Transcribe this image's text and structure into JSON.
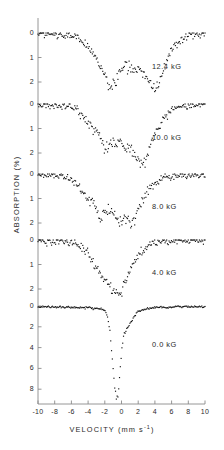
{
  "figure": {
    "xlabel_text": "VELOCITY (mm s",
    "xlabel_sup": "-1",
    "xlabel_tail": ")",
    "ylabel": "ABSORPTION (%)"
  },
  "axis": {
    "x_ticks": [
      -10,
      -8,
      -6,
      -4,
      -2,
      0,
      2,
      4,
      6,
      8,
      10
    ],
    "x_tick_labels": [
      "-10",
      "-8",
      "-6",
      "-4",
      "-2",
      "0",
      "2",
      "4",
      "6",
      "8",
      "10"
    ]
  },
  "panels": [
    {
      "label": "12.4 kG",
      "y_ticks": [
        0,
        1,
        2
      ],
      "y_tick_labels": [
        "0",
        "1",
        "2"
      ]
    },
    {
      "label": "10.0 kG",
      "y_ticks": [
        0,
        1,
        2
      ],
      "y_tick_labels": [
        "0",
        "1",
        "2"
      ]
    },
    {
      "label": "8.0 kG",
      "y_ticks": [
        0,
        1,
        2
      ],
      "y_tick_labels": [
        "0",
        "1",
        "2"
      ]
    },
    {
      "label": "4.0 kG",
      "y_ticks": [
        0,
        1,
        2
      ],
      "y_tick_labels": [
        "0",
        "1",
        "2"
      ]
    },
    {
      "label": "0.0 kG",
      "y_ticks": [
        0,
        2,
        4,
        6,
        8
      ],
      "y_tick_labels": [
        "0",
        "2",
        "4",
        "6",
        "8"
      ]
    }
  ],
  "chart_data": {
    "type": "scatter",
    "title": "",
    "xlabel": "VELOCITY (mm s^-1)",
    "ylabel": "ABSORPTION (%)",
    "xlim": [
      -10,
      10
    ],
    "grid": false,
    "legend": "none",
    "marker_color": "#111111",
    "note": "Mossbauer absorption spectra at five applied magnetic fields; absorption axis increases downward.",
    "panels": [
      {
        "name": "12.4 kG",
        "ylim": [
          0,
          2.6
        ],
        "y_ticks": [
          0,
          1,
          2
        ],
        "x": [
          -10.0,
          -9.6,
          -9.2,
          -8.8,
          -8.4,
          -8.0,
          -7.6,
          -7.2,
          -6.8,
          -6.4,
          -6.0,
          -5.6,
          -5.2,
          -4.8,
          -4.4,
          -4.0,
          -3.6,
          -3.2,
          -2.8,
          -2.4,
          -2.0,
          -1.6,
          -1.2,
          -0.8,
          -0.4,
          0.0,
          0.4,
          0.8,
          1.2,
          1.6,
          2.0,
          2.4,
          2.8,
          3.2,
          3.6,
          4.0,
          4.4,
          4.8,
          5.2,
          5.6,
          6.0,
          6.4,
          6.8,
          7.2,
          7.6,
          8.0,
          8.4,
          8.8,
          9.2,
          9.6,
          10.0
        ],
        "y": [
          0.02,
          0.0,
          0.05,
          0.03,
          0.08,
          0.04,
          0.1,
          0.06,
          0.12,
          0.09,
          0.15,
          0.12,
          0.2,
          0.28,
          0.4,
          0.55,
          0.75,
          0.95,
          1.15,
          1.45,
          1.8,
          2.1,
          2.3,
          2.05,
          1.7,
          1.45,
          1.35,
          1.4,
          1.38,
          1.45,
          1.42,
          1.55,
          1.7,
          1.95,
          2.2,
          2.35,
          2.1,
          1.7,
          1.3,
          1.0,
          0.75,
          0.55,
          0.38,
          0.25,
          0.18,
          0.12,
          0.08,
          0.1,
          0.05,
          0.08,
          0.04
        ]
      },
      {
        "name": "10.0 kG",
        "ylim": [
          0,
          2.6
        ],
        "y_ticks": [
          0,
          1,
          2
        ],
        "x": [
          -10.0,
          -9.6,
          -9.2,
          -8.8,
          -8.4,
          -8.0,
          -7.6,
          -7.2,
          -6.8,
          -6.4,
          -6.0,
          -5.6,
          -5.2,
          -4.8,
          -4.4,
          -4.0,
          -3.6,
          -3.2,
          -2.8,
          -2.4,
          -2.0,
          -1.6,
          -1.2,
          -0.8,
          -0.4,
          0.0,
          0.4,
          0.8,
          1.2,
          1.6,
          2.0,
          2.4,
          2.8,
          3.2,
          3.6,
          4.0,
          4.4,
          4.8,
          5.2,
          5.6,
          6.0,
          6.4,
          6.8,
          7.2,
          7.6,
          8.0,
          8.4,
          8.8,
          9.2,
          9.6,
          10.0
        ],
        "y": [
          0.05,
          0.02,
          0.06,
          0.03,
          0.07,
          0.05,
          0.08,
          0.06,
          0.1,
          0.08,
          0.14,
          0.18,
          0.28,
          0.42,
          0.58,
          0.78,
          0.95,
          1.05,
          1.2,
          1.55,
          1.85,
          1.7,
          1.5,
          1.62,
          1.55,
          1.7,
          1.8,
          1.72,
          1.85,
          2.05,
          2.25,
          2.45,
          2.3,
          1.95,
          1.55,
          1.2,
          0.95,
          0.75,
          0.52,
          0.38,
          0.25,
          0.18,
          0.12,
          0.1,
          0.06,
          0.08,
          0.04,
          0.06,
          0.03,
          0.05,
          0.02
        ]
      },
      {
        "name": "8.0 kG",
        "ylim": [
          0,
          2.6
        ],
        "y_ticks": [
          0,
          1,
          2
        ],
        "x": [
          -10.0,
          -9.6,
          -9.2,
          -8.8,
          -8.4,
          -8.0,
          -7.6,
          -7.2,
          -6.8,
          -6.4,
          -6.0,
          -5.6,
          -5.2,
          -4.8,
          -4.4,
          -4.0,
          -3.6,
          -3.2,
          -2.8,
          -2.4,
          -2.0,
          -1.6,
          -1.2,
          -0.8,
          -0.4,
          0.0,
          0.4,
          0.8,
          1.2,
          1.6,
          2.0,
          2.4,
          2.8,
          3.2,
          3.6,
          4.0,
          4.4,
          4.8,
          5.2,
          5.6,
          6.0,
          6.4,
          6.8,
          7.2,
          7.6,
          8.0,
          8.4,
          8.8,
          9.2,
          9.6,
          10.0
        ],
        "y": [
          0.04,
          0.02,
          0.06,
          0.03,
          0.05,
          0.04,
          0.08,
          0.06,
          0.1,
          0.12,
          0.2,
          0.32,
          0.48,
          0.68,
          0.88,
          1.0,
          1.1,
          1.35,
          1.65,
          1.8,
          1.55,
          1.45,
          1.62,
          1.75,
          1.9,
          1.95,
          1.88,
          1.92,
          2.0,
          1.85,
          1.5,
          1.15,
          0.88,
          0.68,
          0.5,
          0.38,
          0.28,
          0.2,
          0.15,
          0.1,
          0.08,
          0.06,
          0.05,
          0.04,
          0.06,
          0.03,
          0.05,
          0.02,
          0.04,
          0.02,
          0.03
        ]
      },
      {
        "name": "4.0 kG",
        "ylim": [
          0,
          2.6
        ],
        "y_ticks": [
          0,
          1,
          2
        ],
        "x": [
          -10.0,
          -9.6,
          -9.2,
          -8.8,
          -8.4,
          -8.0,
          -7.6,
          -7.2,
          -6.8,
          -6.4,
          -6.0,
          -5.6,
          -5.2,
          -4.8,
          -4.4,
          -4.0,
          -3.6,
          -3.2,
          -2.8,
          -2.4,
          -2.0,
          -1.6,
          -1.2,
          -0.8,
          -0.4,
          0.0,
          0.4,
          0.8,
          1.2,
          1.6,
          2.0,
          2.4,
          2.8,
          3.2,
          3.6,
          4.0,
          4.4,
          4.8,
          5.2,
          5.6,
          6.0,
          6.4,
          6.8,
          7.2,
          7.6,
          8.0,
          8.4,
          8.8,
          9.2,
          9.6,
          10.0
        ],
        "y": [
          0.03,
          0.02,
          0.05,
          0.08,
          0.04,
          0.06,
          0.03,
          0.05,
          0.08,
          0.06,
          0.1,
          0.14,
          0.2,
          0.3,
          0.42,
          0.58,
          0.78,
          1.0,
          1.25,
          1.42,
          1.58,
          1.8,
          2.0,
          2.15,
          2.25,
          2.1,
          1.75,
          1.4,
          1.1,
          0.85,
          0.65,
          0.48,
          0.35,
          0.25,
          0.18,
          0.14,
          0.1,
          0.12,
          0.08,
          0.06,
          0.09,
          0.05,
          0.07,
          0.04,
          0.06,
          0.03,
          0.05,
          0.02,
          0.04,
          0.02,
          0.03
        ]
      },
      {
        "name": "0.0 kG",
        "ylim": [
          0,
          9.5
        ],
        "y_ticks": [
          0,
          2,
          4,
          6,
          8
        ],
        "x": [
          -10.0,
          -9.6,
          -9.2,
          -8.8,
          -8.4,
          -8.0,
          -7.6,
          -7.2,
          -6.8,
          -6.4,
          -6.0,
          -5.6,
          -5.2,
          -4.8,
          -4.4,
          -4.0,
          -3.6,
          -3.2,
          -2.8,
          -2.4,
          -2.0,
          -1.8,
          -1.6,
          -1.4,
          -1.2,
          -1.0,
          -0.8,
          -0.6,
          -0.4,
          -0.2,
          0.0,
          0.2,
          0.4,
          0.8,
          1.2,
          1.6,
          2.0,
          2.4,
          2.8,
          3.2,
          3.6,
          4.0,
          4.4,
          4.8,
          5.2,
          5.6,
          6.0,
          6.4,
          6.8,
          7.2,
          7.6,
          8.0,
          8.4,
          8.8,
          9.2,
          9.6,
          10.0
        ],
        "y": [
          0.05,
          0.02,
          0.08,
          0.04,
          0.1,
          0.06,
          0.12,
          0.08,
          0.14,
          0.1,
          0.16,
          0.12,
          0.18,
          0.14,
          0.2,
          0.16,
          0.22,
          0.18,
          0.25,
          0.3,
          0.45,
          0.7,
          1.3,
          2.4,
          4.0,
          6.0,
          7.8,
          8.9,
          8.6,
          6.5,
          4.2,
          3.0,
          2.6,
          2.0,
          1.4,
          0.9,
          0.55,
          0.4,
          0.3,
          0.22,
          0.18,
          0.15,
          0.12,
          0.14,
          0.1,
          0.12,
          0.08,
          0.1,
          0.06,
          0.09,
          0.05,
          0.08,
          0.04,
          0.07,
          0.03,
          0.06,
          0.02
        ]
      }
    ]
  }
}
